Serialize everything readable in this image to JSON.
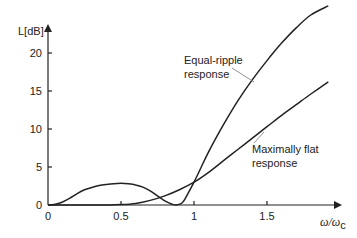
{
  "chart_data": {
    "type": "line",
    "title": "",
    "xlabel": "ω/ω",
    "xlabel_sub": "c",
    "ylabel": "L[dB]",
    "xlim": [
      0,
      1.98
    ],
    "ylim": [
      0,
      27
    ],
    "grid": false,
    "x_ticks": [
      {
        "value": 0,
        "label": "0"
      },
      {
        "value": 0.5,
        "label": "0.5"
      },
      {
        "value": 1,
        "label": "1"
      },
      {
        "value": 1.5,
        "label": "1.5"
      }
    ],
    "y_ticks": [
      {
        "value": 0,
        "label": "0"
      },
      {
        "value": 5,
        "label": "5"
      },
      {
        "value": 10,
        "label": "10"
      },
      {
        "value": 15,
        "label": "15"
      },
      {
        "value": 20,
        "label": "20"
      }
    ],
    "series": [
      {
        "name": "Equal-ripple response",
        "annotation": [
          "Equal-ripple",
          "response"
        ],
        "x": [
          0,
          0.05,
          0.1,
          0.15,
          0.2,
          0.25,
          0.3,
          0.35,
          0.4,
          0.45,
          0.5,
          0.55,
          0.6,
          0.65,
          0.7,
          0.75,
          0.8,
          0.85,
          0.88,
          0.92,
          0.95,
          1.0,
          1.05,
          1.1,
          1.2,
          1.3,
          1.4,
          1.5,
          1.6,
          1.7,
          1.8,
          1.92
        ],
        "y": [
          0,
          0.1,
          0.4,
          0.9,
          1.5,
          2.0,
          2.3,
          2.55,
          2.7,
          2.8,
          2.85,
          2.8,
          2.65,
          2.35,
          1.85,
          1.2,
          0.55,
          0.1,
          0.0,
          0.3,
          1.2,
          3.0,
          5.0,
          7.0,
          10.5,
          13.7,
          16.5,
          19.0,
          21.3,
          23.3,
          25.0,
          26.2
        ]
      },
      {
        "name": "Maximally flat response",
        "annotation": [
          "Maximally flat",
          "response"
        ],
        "x": [
          0,
          0.2,
          0.4,
          0.5,
          0.6,
          0.7,
          0.8,
          0.9,
          1.0,
          1.1,
          1.2,
          1.3,
          1.4,
          1.5,
          1.6,
          1.7,
          1.8,
          1.92
        ],
        "y": [
          0,
          0,
          0.0,
          0.05,
          0.2,
          0.6,
          1.2,
          2.0,
          3.0,
          4.3,
          5.8,
          7.3,
          8.8,
          10.3,
          11.8,
          13.2,
          14.6,
          16.2
        ]
      }
    ]
  }
}
